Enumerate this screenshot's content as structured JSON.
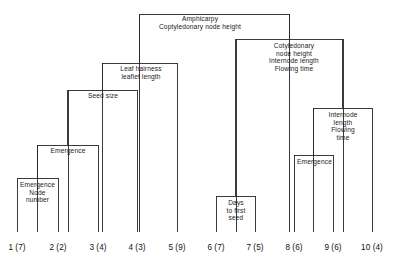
{
  "figure": {
    "kind": "dendrogram",
    "orientation": "top-root",
    "width": 400,
    "height": 269,
    "line_color": "#262626",
    "text_color": "#1a1a1a",
    "background": "#ffffff"
  },
  "chart_data": {
    "type": "table",
    "title": "",
    "xlabel": "",
    "ylabel": "",
    "grid": false,
    "legend": "none",
    "leaves": [
      {
        "id": 1,
        "label": "1 (7)",
        "x": 17,
        "group": 1,
        "count": 7
      },
      {
        "id": 2,
        "label": "2 (2)",
        "x": 58,
        "group": 2,
        "count": 2
      },
      {
        "id": 3,
        "label": "3 (4)",
        "x": 98,
        "group": 3,
        "count": 4
      },
      {
        "id": 4,
        "label": "4 (3)",
        "x": 137,
        "group": 4,
        "count": 3
      },
      {
        "id": 5,
        "label": "5 (9)",
        "x": 177,
        "group": 5,
        "count": 9
      },
      {
        "id": 6,
        "label": "6 (7)",
        "x": 216,
        "group": 6,
        "count": 7
      },
      {
        "id": 7,
        "label": "7 (5)",
        "x": 255,
        "group": 7,
        "count": 5
      },
      {
        "id": 8,
        "label": "8 (6)",
        "x": 294,
        "group": 8,
        "count": 6
      },
      {
        "id": 9,
        "label": "9 (6)",
        "x": 333,
        "group": 9,
        "count": 6
      },
      {
        "id": 10,
        "label": "10 (4)",
        "x": 372,
        "group": 10,
        "count": 4
      }
    ],
    "merges": [
      {
        "id": "m1",
        "left_x": 17,
        "right_x": 58,
        "y": 178,
        "label": "Emergence\nNode\nnumber"
      },
      {
        "id": "m2",
        "left_x": 37,
        "right_x": 98,
        "y": 145,
        "label": "Emergence"
      },
      {
        "id": "m3",
        "left_x": 68,
        "right_x": 137,
        "y": 90,
        "label": "Seed size"
      },
      {
        "id": "m4",
        "left_x": 102,
        "right_x": 177,
        "y": 63,
        "label": "Leaf hairness\nleaflet length"
      },
      {
        "id": "m5",
        "left_x": 216,
        "right_x": 255,
        "y": 196,
        "label": "Days\nto first\nseed"
      },
      {
        "id": "m6",
        "left_x": 294,
        "right_x": 333,
        "y": 155,
        "label": "Emergence"
      },
      {
        "id": "m7",
        "left_x": 313,
        "right_x": 372,
        "y": 108,
        "label": "Internode\nlength\nFlowing\ntime"
      },
      {
        "id": "m8",
        "left_x": 236,
        "right_x": 343,
        "y": 39,
        "label": "Cotyledonary\nnode height\nInternode length\nFlowing time"
      },
      {
        "id": "m9",
        "left_x": 139,
        "right_x": 289,
        "y": 14,
        "label": "Amphicarpy\nCoptyledonary node height"
      }
    ],
    "baseline_y": 232
  },
  "labels": {
    "root": "Amphicarpy\nCoptyledonary node height",
    "right_major": "Cotyledonary\nnode height\nInternode length\nFlowing time",
    "leaf_hairness": "Leaf hairness\nleaflet length",
    "seed_size": "Seed size",
    "emergence_left": "Emergence",
    "emergence_node_number": "Emergence\nNode\nnumber",
    "days_first_seed": "Days\nto first\nseed",
    "internode_flowing": "Internode\nlength\nFlowing\ntime",
    "emergence_right": "Emergence"
  }
}
